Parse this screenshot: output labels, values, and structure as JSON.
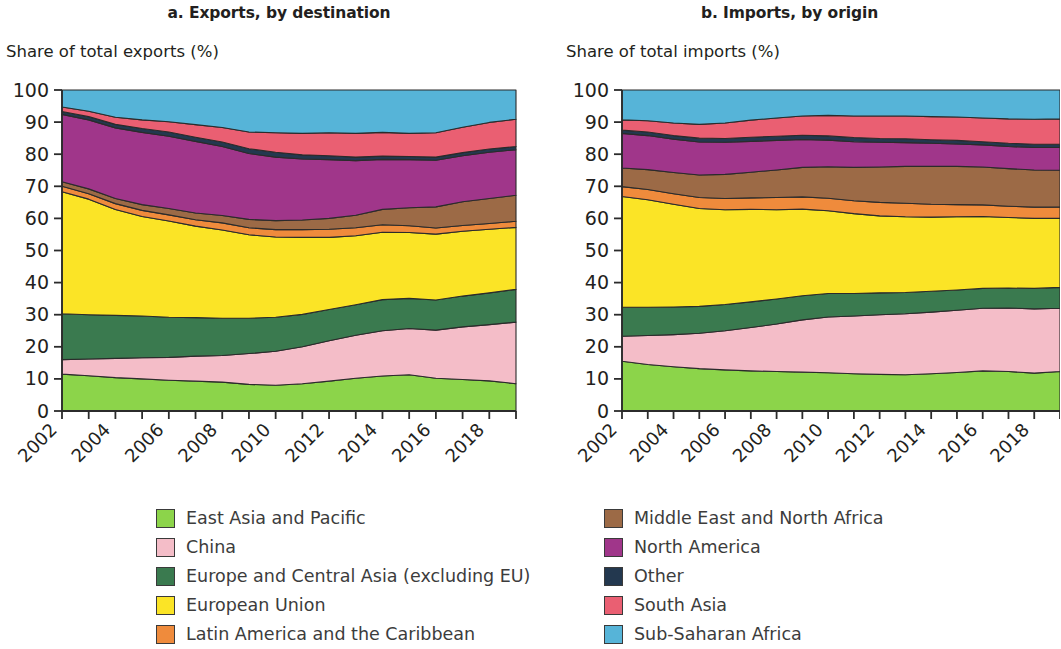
{
  "panels": [
    {
      "id": "exports",
      "title": "a. Exports, by destination",
      "axis_title": "Share of total exports (%)"
    },
    {
      "id": "imports",
      "title": "b. Imports, by origin",
      "axis_title": "Share of total imports (%)"
    }
  ],
  "legend": {
    "left_column": [
      {
        "label": "East Asia and Pacific",
        "color": "#8cd44a"
      },
      {
        "label": "China",
        "color": "#f4bdc8"
      },
      {
        "label": "Europe and Central Asia (excluding EU)",
        "color": "#3a7a4f"
      },
      {
        "label": "European Union",
        "color": "#fbe426"
      },
      {
        "label": "Latin America and the Caribbean",
        "color": "#ef8b3c"
      }
    ],
    "right_column": [
      {
        "label": "Middle East and North Africa",
        "color": "#9c6a46"
      },
      {
        "label": "North America",
        "color": "#a0368a"
      },
      {
        "label": "Other",
        "color": "#23384f"
      },
      {
        "label": "South Asia",
        "color": "#ea5f72"
      },
      {
        "label": "Sub-Saharan Africa",
        "color": "#56b4d8"
      }
    ]
  },
  "chart_data": [
    {
      "id": "exports",
      "type": "area",
      "stacked": true,
      "normalized": true,
      "title": "a. Exports, by destination",
      "xlabel": "",
      "ylabel": "Share of total exports (%)",
      "ylim": [
        0,
        100
      ],
      "yticks": [
        0,
        10,
        20,
        30,
        40,
        50,
        60,
        70,
        80,
        90,
        100
      ],
      "xlim": [
        2002,
        2019
      ],
      "xticks": [
        2002,
        2004,
        2006,
        2008,
        2010,
        2012,
        2014,
        2016,
        2018
      ],
      "grid": false,
      "legend_position": "bottom",
      "x": [
        2002,
        2003,
        2004,
        2005,
        2006,
        2007,
        2008,
        2009,
        2010,
        2011,
        2012,
        2013,
        2014,
        2015,
        2016,
        2017,
        2018,
        2019
      ],
      "series": [
        {
          "name": "East Asia and Pacific",
          "color": "#8cd44a",
          "values": [
            11.5,
            11.0,
            10.4,
            10.0,
            9.6,
            9.3,
            9.0,
            8.3,
            8.0,
            8.5,
            9.3,
            10.2,
            10.9,
            11.3,
            10.2,
            9.8,
            9.4,
            8.5
          ]
        },
        {
          "name": "China",
          "color": "#f4bdc8",
          "values": [
            4.5,
            5.2,
            6.0,
            6.6,
            7.1,
            7.8,
            8.3,
            9.6,
            10.6,
            11.5,
            12.6,
            13.4,
            14.1,
            14.4,
            15.0,
            16.4,
            17.5,
            19.2
          ]
        },
        {
          "name": "Europe and Central Asia (excluding EU)",
          "color": "#3a7a4f",
          "values": [
            14.3,
            13.8,
            13.4,
            13.0,
            12.5,
            12.0,
            11.6,
            11.0,
            10.6,
            10.1,
            9.7,
            9.5,
            9.7,
            9.4,
            9.4,
            9.6,
            9.9,
            10.2
          ]
        },
        {
          "name": "European Union",
          "color": "#fbe426",
          "values": [
            38.0,
            36.0,
            33.0,
            31.0,
            30.0,
            28.5,
            27.5,
            26.0,
            25.0,
            24.0,
            22.5,
            21.5,
            21.0,
            20.5,
            20.5,
            20.2,
            19.8,
            19.3
          ]
        },
        {
          "name": "Latin America and the Caribbean",
          "color": "#ef8b3c",
          "values": [
            1.7,
            1.7,
            1.8,
            1.9,
            1.9,
            2.0,
            2.2,
            2.2,
            2.3,
            2.4,
            2.5,
            2.5,
            2.3,
            2.1,
            1.9,
            1.8,
            1.8,
            1.9
          ]
        },
        {
          "name": "Middle East and North Africa",
          "color": "#9c6a46",
          "values": [
            1.4,
            1.5,
            1.6,
            1.8,
            2.0,
            2.1,
            2.3,
            2.6,
            2.8,
            3.0,
            3.4,
            3.9,
            4.8,
            5.6,
            6.6,
            7.4,
            7.8,
            8.1
          ]
        },
        {
          "name": "North America",
          "color": "#a0368a",
          "values": [
            21.0,
            21.5,
            22.0,
            22.5,
            22.5,
            22.3,
            21.5,
            20.5,
            19.8,
            19.0,
            18.3,
            17.0,
            15.6,
            15.0,
            14.5,
            14.3,
            14.4,
            14.2
          ]
        },
        {
          "name": "Other",
          "color": "#23384f",
          "values": [
            0.9,
            1.0,
            1.1,
            1.2,
            1.3,
            1.3,
            1.4,
            1.5,
            1.5,
            1.3,
            1.2,
            1.1,
            1.0,
            1.0,
            1.0,
            1.0,
            1.0,
            1.0
          ]
        },
        {
          "name": "South Asia",
          "color": "#ea5f72",
          "values": [
            1.4,
            1.7,
            2.2,
            2.7,
            3.2,
            3.9,
            4.5,
            5.2,
            6.1,
            6.7,
            7.2,
            7.4,
            7.4,
            7.2,
            7.6,
            7.9,
            8.3,
            8.5
          ]
        },
        {
          "name": "Sub-Saharan Africa",
          "color": "#56b4d8",
          "values": [
            5.3,
            6.6,
            8.5,
            9.3,
            9.9,
            10.8,
            11.7,
            13.1,
            13.3,
            13.5,
            13.3,
            13.5,
            13.2,
            13.5,
            13.3,
            11.6,
            10.1,
            9.1
          ]
        }
      ]
    },
    {
      "id": "imports",
      "type": "area",
      "stacked": true,
      "normalized": true,
      "title": "b. Imports, by origin",
      "xlabel": "",
      "ylabel": "Share of total imports (%)",
      "ylim": [
        0,
        100
      ],
      "yticks": [
        0,
        10,
        20,
        30,
        40,
        50,
        60,
        70,
        80,
        90,
        100
      ],
      "xlim": [
        2002,
        2019
      ],
      "xticks": [
        2002,
        2004,
        2006,
        2008,
        2010,
        2012,
        2014,
        2016,
        2018
      ],
      "grid": false,
      "legend_position": "bottom",
      "x": [
        2002,
        2003,
        2004,
        2005,
        2006,
        2007,
        2008,
        2009,
        2010,
        2011,
        2012,
        2013,
        2014,
        2015,
        2016,
        2017,
        2018,
        2019
      ],
      "series": [
        {
          "name": "East Asia and Pacific",
          "color": "#8cd44a",
          "values": [
            15.5,
            14.5,
            13.8,
            13.2,
            12.8,
            12.5,
            12.3,
            12.1,
            11.9,
            11.6,
            11.4,
            11.3,
            11.6,
            12.0,
            12.5,
            12.3,
            11.8,
            12.3
          ]
        },
        {
          "name": "China",
          "color": "#f4bdc8",
          "values": [
            7.8,
            9.0,
            10.0,
            11.0,
            12.2,
            13.5,
            14.8,
            16.3,
            17.4,
            18.0,
            18.6,
            19.0,
            19.2,
            19.4,
            19.5,
            19.8,
            20.0,
            19.7
          ]
        },
        {
          "name": "Europe and Central Asia (excluding EU)",
          "color": "#3a7a4f",
          "values": [
            9.0,
            8.8,
            8.6,
            8.4,
            8.2,
            8.0,
            7.8,
            7.5,
            7.3,
            7.0,
            6.8,
            6.6,
            6.5,
            6.3,
            6.2,
            6.2,
            6.4,
            6.5
          ]
        },
        {
          "name": "European Union",
          "color": "#fbe426",
          "values": [
            34.5,
            33.5,
            32.0,
            30.5,
            29.5,
            28.8,
            27.8,
            27.0,
            25.8,
            24.9,
            24.0,
            23.6,
            23.1,
            22.8,
            22.4,
            22.0,
            21.8,
            21.5
          ]
        },
        {
          "name": "Latin America and the Caribbean",
          "color": "#ef8b3c",
          "values": [
            3.1,
            3.2,
            3.3,
            3.4,
            3.5,
            3.6,
            3.8,
            3.8,
            3.9,
            4.0,
            4.2,
            4.2,
            4.0,
            3.8,
            3.6,
            3.5,
            3.5,
            3.6
          ]
        },
        {
          "name": "Middle East and North Africa",
          "color": "#9c6a46",
          "values": [
            5.8,
            6.2,
            6.6,
            7.0,
            7.5,
            8.0,
            8.6,
            9.2,
            9.8,
            10.4,
            11.0,
            11.5,
            11.8,
            11.9,
            11.8,
            11.7,
            11.6,
            11.4
          ]
        },
        {
          "name": "North America",
          "color": "#a0368a",
          "values": [
            10.8,
            10.6,
            10.4,
            10.3,
            10.0,
            9.6,
            9.2,
            8.7,
            8.3,
            8.0,
            7.7,
            7.4,
            7.2,
            7.0,
            6.9,
            6.9,
            7.0,
            7.1
          ]
        },
        {
          "name": "Other",
          "color": "#23384f",
          "values": [
            1.0,
            1.1,
            1.1,
            1.2,
            1.2,
            1.3,
            1.3,
            1.3,
            1.3,
            1.3,
            1.2,
            1.2,
            1.1,
            1.1,
            1.0,
            1.0,
            1.0,
            1.0
          ]
        },
        {
          "name": "South Asia",
          "color": "#ea5f72",
          "values": [
            3.2,
            3.5,
            3.9,
            4.3,
            4.8,
            5.3,
            5.7,
            6.0,
            6.4,
            6.7,
            7.0,
            7.1,
            7.2,
            7.3,
            7.4,
            7.6,
            7.8,
            7.9
          ]
        },
        {
          "name": "Sub-Saharan Africa",
          "color": "#56b4d8",
          "values": [
            9.3,
            9.6,
            10.3,
            10.7,
            10.3,
            9.4,
            8.7,
            8.1,
            7.9,
            8.1,
            8.1,
            8.1,
            8.3,
            8.4,
            8.7,
            9.0,
            9.1,
            9.0
          ]
        }
      ]
    }
  ]
}
